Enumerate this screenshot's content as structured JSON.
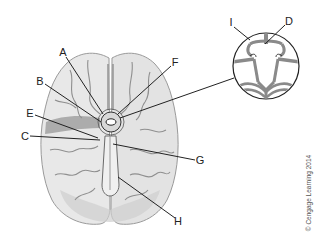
{
  "figure": {
    "copyright": "© Cengage Learning 2014",
    "colors": {
      "brain_fill": "#e6e6e6",
      "brain_outline": "#9a9a9a",
      "vessel": "#8a8a8a",
      "leader_line": "#222222",
      "label_text": "#222222"
    }
  },
  "labels": [
    {
      "id": "A",
      "text": "A",
      "x": 63,
      "y": 52,
      "target": [
        103,
        114
      ]
    },
    {
      "id": "B",
      "text": "B",
      "x": 40,
      "y": 81,
      "target": [
        101,
        122
      ]
    },
    {
      "id": "E",
      "text": "E",
      "x": 30,
      "y": 113,
      "target": [
        98,
        138
      ]
    },
    {
      "id": "C",
      "text": "C",
      "x": 25,
      "y": 136,
      "target": [
        100,
        140
      ]
    },
    {
      "id": "F",
      "text": "F",
      "x": 175,
      "y": 62,
      "target": [
        118,
        114
      ]
    },
    {
      "id": "G",
      "text": "G",
      "x": 200,
      "y": 160,
      "target": [
        113,
        144
      ]
    },
    {
      "id": "H",
      "text": "H",
      "x": 178,
      "y": 221,
      "target": [
        118,
        177
      ]
    },
    {
      "id": "I",
      "text": "I",
      "x": 231,
      "y": 22,
      "target": [
        250,
        40
      ]
    },
    {
      "id": "D",
      "text": "D",
      "x": 289,
      "y": 21,
      "target": [
        265,
        44
      ]
    }
  ],
  "callout": {
    "source_circle": {
      "cx": 111,
      "cy": 122,
      "r": 10
    },
    "magnified_circle": {
      "cx": 266,
      "cy": 66,
      "r": 33
    }
  }
}
